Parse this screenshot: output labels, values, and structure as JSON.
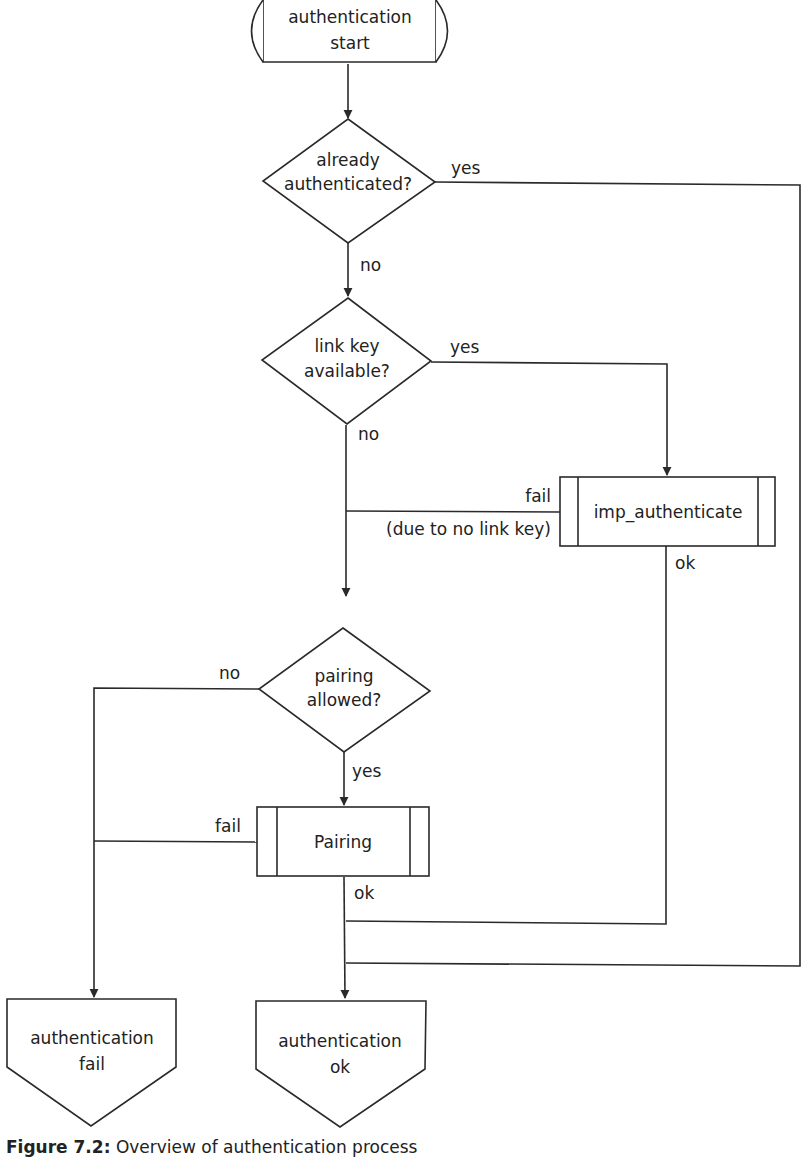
{
  "diagram": {
    "type": "flowchart",
    "nodes": {
      "start": {
        "shape": "terminator",
        "lines": [
          "authentication",
          "start"
        ]
      },
      "already_authenticated": {
        "shape": "decision",
        "lines": [
          "already",
          "authenticated?"
        ]
      },
      "link_key_available": {
        "shape": "decision",
        "lines": [
          "link key",
          "available?"
        ]
      },
      "imp_authenticate": {
        "shape": "predefined-process",
        "label": "imp_authenticate"
      },
      "pairing_allowed": {
        "shape": "decision",
        "lines": [
          "pairing",
          "allowed?"
        ]
      },
      "pairing": {
        "shape": "predefined-process",
        "label": "Pairing"
      },
      "auth_fail": {
        "shape": "off-page-connector",
        "lines": [
          "authentication",
          "fail"
        ]
      },
      "auth_ok": {
        "shape": "off-page-connector",
        "lines": [
          "authentication",
          "ok"
        ]
      }
    },
    "edge_labels": {
      "already_yes": "yes",
      "already_no": "no",
      "linkkey_yes": "yes",
      "linkkey_no": "no",
      "imp_fail": "fail",
      "imp_fail_reason": "(due to no link key)",
      "imp_ok": "ok",
      "pairing_allowed_no": "no",
      "pairing_allowed_yes": "yes",
      "pairing_fail": "fail",
      "pairing_ok": "ok"
    },
    "edges": [
      {
        "from": "start",
        "to": "already_authenticated"
      },
      {
        "from": "already_authenticated",
        "to": "auth_ok",
        "label": "yes"
      },
      {
        "from": "already_authenticated",
        "to": "link_key_available",
        "label": "no"
      },
      {
        "from": "link_key_available",
        "to": "imp_authenticate",
        "label": "yes"
      },
      {
        "from": "link_key_available",
        "to": "pairing_allowed",
        "label": "no"
      },
      {
        "from": "imp_authenticate",
        "to": "pairing_allowed",
        "label": "fail (due to no link key)"
      },
      {
        "from": "imp_authenticate",
        "to": "auth_ok",
        "label": "ok"
      },
      {
        "from": "pairing_allowed",
        "to": "auth_fail",
        "label": "no"
      },
      {
        "from": "pairing_allowed",
        "to": "pairing",
        "label": "yes"
      },
      {
        "from": "pairing",
        "to": "auth_fail",
        "label": "fail"
      },
      {
        "from": "pairing",
        "to": "auth_ok",
        "label": "ok"
      }
    ]
  },
  "caption": {
    "prefix": "Figure 7.2:",
    "text": "Overview of authentication process"
  }
}
